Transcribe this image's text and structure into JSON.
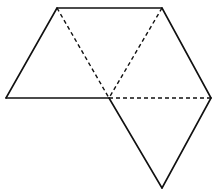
{
  "diagram": {
    "type": "net-of-triangles",
    "stroke_color": "#111111",
    "background": "#ffffff",
    "vertices": {
      "A": [
        57,
        8
      ],
      "B": [
        162,
        8
      ],
      "C": [
        6,
        98
      ],
      "O": [
        109,
        98
      ],
      "D": [
        211,
        98
      ],
      "E": [
        162,
        188
      ]
    },
    "solid_edges": [
      [
        "A",
        "B"
      ],
      [
        "A",
        "C"
      ],
      [
        "C",
        "O"
      ],
      [
        "B",
        "D"
      ],
      [
        "O",
        "E"
      ],
      [
        "D",
        "E"
      ]
    ],
    "dashed_edges": [
      [
        "A",
        "O"
      ],
      [
        "B",
        "O"
      ],
      [
        "O",
        "D"
      ]
    ]
  }
}
